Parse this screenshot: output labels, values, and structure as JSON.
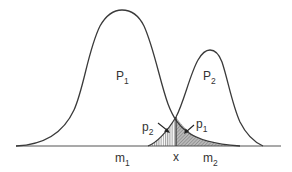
{
  "figure": {
    "type": "overlapping-distributions",
    "distributions": [
      {
        "id": "P1",
        "label": "P",
        "subscript": "1",
        "mean_label": "m",
        "mean_subscript": "1"
      },
      {
        "id": "P2",
        "label": "P",
        "subscript": "2",
        "mean_label": "m",
        "mean_subscript": "2"
      }
    ],
    "threshold_label": "x",
    "error_regions": [
      {
        "label": "p",
        "subscript": "2",
        "hatch": "vertical",
        "side": "left of x"
      },
      {
        "label": "p",
        "subscript": "1",
        "hatch": "diagonal",
        "side": "right of x"
      }
    ],
    "colors": {
      "line": "#3a3a3a",
      "axis": "#555555",
      "hatch_fill": "#bdbdbd",
      "background": "#ffffff"
    }
  },
  "labels": {
    "P1": {
      "main": "P",
      "sub": "1"
    },
    "P2": {
      "main": "P",
      "sub": "2"
    },
    "p2": {
      "main": "p",
      "sub": "2"
    },
    "p1": {
      "main": "p",
      "sub": "1"
    },
    "m1": {
      "main": "m",
      "sub": "1"
    },
    "m2": {
      "main": "m",
      "sub": "2"
    },
    "x": {
      "main": "x"
    }
  }
}
